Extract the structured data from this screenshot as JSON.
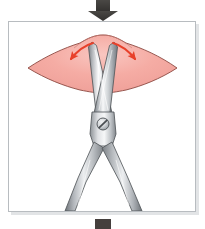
{
  "figure": {
    "title": "Blunt dissection with surgical scissors spreading tissue",
    "background_color": "#ffffff",
    "frame": {
      "name": "illustration-frame",
      "x": 8,
      "y": 21,
      "width": 188,
      "height": 191,
      "border_color": "#b8bcc0",
      "fill_color": "#ffffff",
      "shadow_color": "#c9ccd0"
    },
    "force_arrow_top": {
      "name": "downward-force-arrow",
      "label": "downward force",
      "color": "#3a3a38",
      "direction": "down",
      "shaft_x": 96,
      "shaft_y": 0,
      "shaft_width": 14,
      "shaft_height": 12,
      "head_width": 30,
      "head_height": 9,
      "tip_y": 21
    },
    "force_arrow_bottom": {
      "name": "bottom-force-arrow-stub",
      "label": "lower force marker",
      "color": "#453f3d",
      "x": 95,
      "y": 219,
      "width": 16,
      "height": 10
    },
    "tissue": {
      "name": "tissue-mass",
      "label": "tissue",
      "fill_color": "#f5aca4",
      "stroke_color": "#8c4a42",
      "highlight_color": "#f9c8c2",
      "left_tip_x": 28,
      "left_tip_y": 68,
      "right_tip_x": 177,
      "right_tip_y": 68,
      "mound_peak_x": 103,
      "mound_peak_y": 36,
      "bottom_y": 90
    },
    "spread_arrows": [
      {
        "name": "tissue-spread-arrow-left",
        "label": "tissue spreads left",
        "color": "#e8402a",
        "from_x": 92,
        "from_y": 44,
        "to_x": 70,
        "to_y": 60,
        "curve": "outward"
      },
      {
        "name": "tissue-spread-arrow-right",
        "label": "tissue spreads right",
        "color": "#e8402a",
        "from_x": 114,
        "from_y": 44,
        "to_x": 136,
        "to_y": 60,
        "curve": "outward"
      }
    ],
    "scissors": {
      "name": "surgical-scissors",
      "label": "surgical scissors",
      "metal_light": "#fdfdfd",
      "metal_mid": "#c6c9cc",
      "metal_dark": "#8e9297",
      "metal_shadow": "#6d7176",
      "outline_color": "#54585c",
      "pivot": {
        "name": "scissors-pivot-screw",
        "label": "pivot screw",
        "cx": 103,
        "cy": 124,
        "r": 6,
        "fill_color": "#d8dadd",
        "slot_color": "#4a4e52"
      },
      "blade_left": {
        "name": "scissors-blade-left",
        "tip_x": 92,
        "tip_y": 42
      },
      "blade_right": {
        "name": "scissors-blade-right",
        "tip_x": 114,
        "tip_y": 42
      },
      "handle_left": {
        "name": "scissors-handle-left",
        "end_x": 70,
        "end_y": 210
      },
      "handle_right": {
        "name": "scissors-handle-right",
        "end_x": 137,
        "end_y": 210
      }
    }
  }
}
